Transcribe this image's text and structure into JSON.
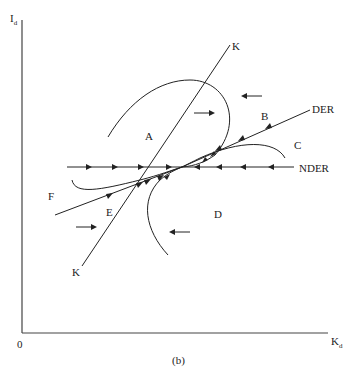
{
  "figure": {
    "caption": "(b)",
    "axes": {
      "y_label": {
        "main": "I",
        "sub": "d"
      },
      "x_label": {
        "main": "K",
        "sub": "d"
      },
      "origin": "0"
    },
    "lines": {
      "k_top_label": "K",
      "k_bottom_label": "K",
      "der_label": "DER",
      "nder_label": "NDER",
      "f_label": "F"
    },
    "regions": [
      "A",
      "B",
      "C",
      "D",
      "E"
    ]
  }
}
